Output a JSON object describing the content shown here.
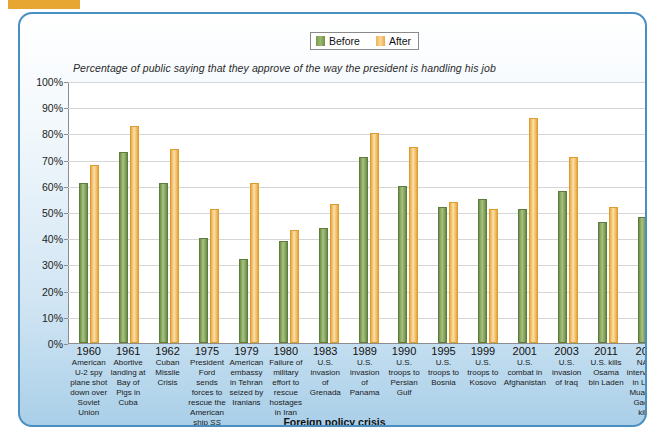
{
  "header": {
    "badge_label": "",
    "title": ""
  },
  "legend": {
    "before_label": "Before",
    "after_label": "After",
    "before_color": "#8aa961",
    "after_color": "#f0b254"
  },
  "subtitle": "Percentage of public saying that they approve of the way the president is handling his job",
  "yticks": [
    "100%",
    "90%",
    "80%",
    "70%",
    "60%",
    "50%",
    "40%",
    "30%",
    "20%",
    "10%",
    "0%"
  ],
  "xaxis_title": "Foreign policy crisis",
  "chart_data": {
    "type": "bar",
    "title": "",
    "subtitle": "Percentage of public saying that they approve of the way the president is handling his job",
    "xlabel": "Foreign policy crisis",
    "ylabel": "",
    "ylim": [
      0,
      100
    ],
    "ytick_values": [
      0,
      10,
      20,
      30,
      40,
      50,
      60,
      70,
      80,
      90,
      100
    ],
    "grid": true,
    "legend_position": "top-center",
    "categories": [
      "1960 American U-2 spy plane shot down over Soviet Union",
      "1961 Abortive landing at Bay of Pigs in Cuba",
      "1962 Cuban Missile Crisis",
      "1975 President Ford sends forces to rescue the American ship SS Mayaguez",
      "1979 American embassy in Tehran seized by Iranians",
      "1980 Failure of military effort to rescue hostages in Iran",
      "1983 U.S. invasion of Grenada",
      "1989 U.S. invasion of Panama",
      "1990 U.S. troops to Persian Gulf",
      "1995 U.S. troops to Bosnia",
      "1999 U.S. troops to Kosovo",
      "2001 U.S. combat in Afghanistan",
      "2003 U.S. invasion of Iraq",
      "2011 U.S. kills Osama bin Laden",
      "2011 NATO intervention in Libya; Muammar Gaddafi killed"
    ],
    "category_years": [
      "1960",
      "1961",
      "1962",
      "1975",
      "1979",
      "1980",
      "1983",
      "1989",
      "1990",
      "1995",
      "1999",
      "2001",
      "2003",
      "2011",
      "2011"
    ],
    "category_descriptions": [
      "American U-2 spy plane shot down over Soviet Union",
      "Abortive landing at Bay of Pigs in Cuba",
      "Cuban Missile Crisis",
      "President Ford sends forces to rescue the American ship SS Mayaguez",
      "American embassy in Tehran seized by Iranians",
      "Failure of military effort to rescue hostages in Iran",
      "U.S. invasion of Grenada",
      "U.S. invasion of Panama",
      "U.S. troops to Persian Gulf",
      "U.S. troops to Bosnia",
      "U.S. troops to Kosovo",
      "U.S. combat in Afghanistan",
      "U.S. invasion of Iraq",
      "U.S. kills Osama bin Laden",
      "NATO intervention in Libya; Muammar Gaddafi killed"
    ],
    "series": [
      {
        "name": "Before",
        "color": "#8aa961",
        "values": [
          61,
          73,
          61,
          40,
          32,
          39,
          44,
          71,
          60,
          52,
          55,
          51,
          58,
          46,
          48
        ]
      },
      {
        "name": "After",
        "color": "#f0b254",
        "values": [
          68,
          83,
          74,
          51,
          61,
          43,
          53,
          80,
          75,
          54,
          51,
          86,
          71,
          52,
          45
        ]
      }
    ]
  }
}
